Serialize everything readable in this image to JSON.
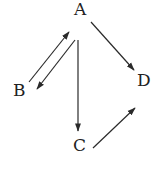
{
  "diagram": {
    "nodes": [
      {
        "id": "A",
        "label": "A",
        "x": 74,
        "y": 1
      },
      {
        "id": "B",
        "label": "B",
        "x": 13,
        "y": 82
      },
      {
        "id": "C",
        "label": "C",
        "x": 73,
        "y": 137
      },
      {
        "id": "D",
        "label": "D",
        "x": 138,
        "y": 72
      }
    ],
    "edges": [
      {
        "from": "B",
        "to": "A"
      },
      {
        "from": "A",
        "to": "B"
      },
      {
        "from": "A",
        "to": "C"
      },
      {
        "from": "A",
        "to": "D"
      },
      {
        "from": "C",
        "to": "D"
      }
    ],
    "colors": {
      "line": "#2a2a2a",
      "text": "#222222"
    }
  }
}
